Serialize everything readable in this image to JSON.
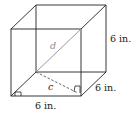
{
  "figure": {
    "type": "cube",
    "labels": {
      "height": "6 in.",
      "depth": "6 in.",
      "width": "6 in.",
      "space_diagonal": "d",
      "face_diagonal": "c"
    },
    "colors": {
      "edges": "#222222",
      "diagonal_d": "#9a9a9a",
      "dashed_c": "#555555"
    }
  }
}
